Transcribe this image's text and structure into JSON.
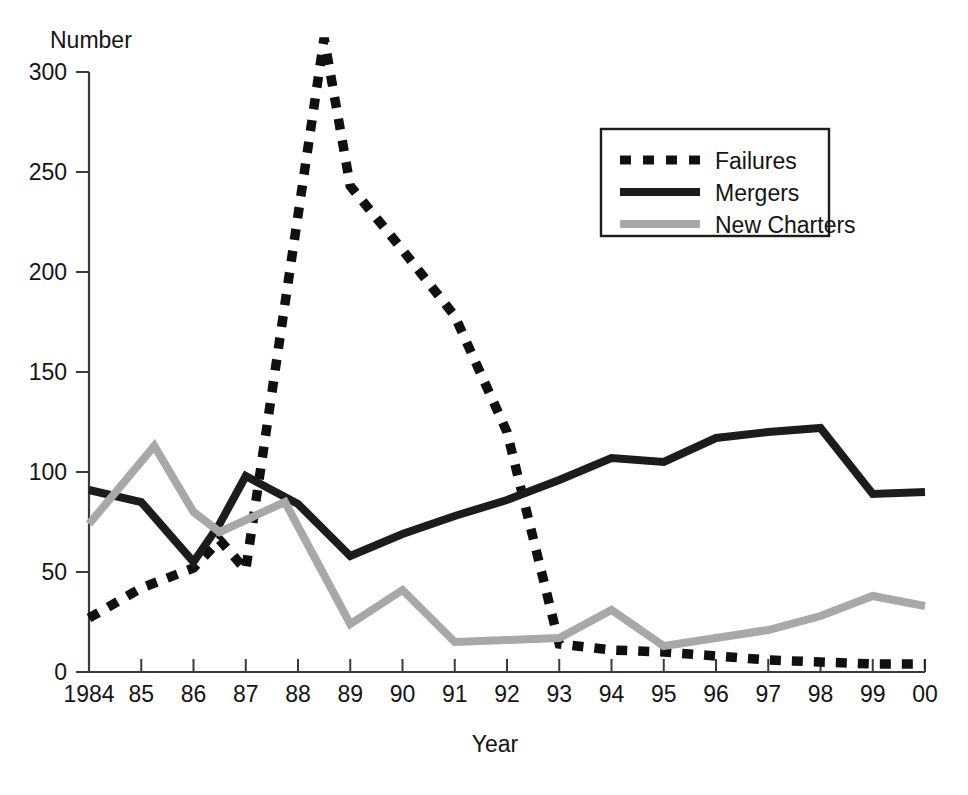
{
  "chart_data": {
    "type": "line",
    "title": "",
    "xlabel": "Year",
    "ylabel": "Number",
    "ylim": [
      0,
      300
    ],
    "yticks": [
      0,
      50,
      100,
      150,
      200,
      250,
      300
    ],
    "xlim": [
      1984,
      2000
    ],
    "xticks": [
      1984,
      1985,
      1986,
      1987,
      1988,
      1989,
      1990,
      1991,
      1992,
      1993,
      1994,
      1995,
      1996,
      1997,
      1998,
      1999,
      2000
    ],
    "xtick_labels": [
      "1984",
      "85",
      "86",
      "87",
      "88",
      "89",
      "90",
      "91",
      "92",
      "93",
      "94",
      "95",
      "96",
      "97",
      "98",
      "99",
      "00"
    ],
    "grid": false,
    "legend_position": "upper right",
    "x": [
      1984,
      1984.5,
      1985,
      1985.25,
      1985.5,
      1986,
      1986.5,
      1987,
      1987.75,
      1988,
      1988.5,
      1989,
      1990,
      1991,
      1992,
      1993,
      1994,
      1995,
      1996,
      1997,
      1998,
      1999,
      2000
    ],
    "series": [
      {
        "name": "Failures",
        "style": "dashed",
        "color": "#101010",
        "x": [
          1984,
          1985,
          1986,
          1986.5,
          1987,
          1988.5,
          1989,
          1990,
          1991,
          1992,
          1993,
          1994,
          1995,
          1996,
          1997,
          1998,
          1999,
          2000
        ],
        "values": [
          27,
          42,
          52,
          66,
          51,
          317,
          243,
          211,
          178,
          120,
          14,
          11,
          10,
          8,
          6,
          5,
          4,
          4
        ]
      },
      {
        "name": "Mergers",
        "style": "solid",
        "color": "#1c1c1c",
        "x": [
          1984,
          1985,
          1986,
          1986.5,
          1987,
          1988,
          1989,
          1990,
          1991,
          1992,
          1993,
          1994,
          1995,
          1996,
          1997,
          1998,
          1999,
          2000
        ],
        "values": [
          91,
          85,
          55,
          74,
          98,
          84,
          58,
          69,
          78,
          86,
          96,
          107,
          105,
          117,
          120,
          122,
          89,
          90
        ]
      },
      {
        "name": "New Charters",
        "style": "solid",
        "color": "#a8a8a8",
        "x": [
          1984,
          1985.25,
          1986,
          1986.5,
          1987.75,
          1989,
          1990,
          1991,
          1992,
          1993,
          1994,
          1995,
          1996,
          1997,
          1998,
          1999,
          2000
        ],
        "values": [
          74,
          113,
          80,
          70,
          85,
          24,
          41,
          15,
          16,
          17,
          31,
          13,
          17,
          21,
          28,
          38,
          33
        ]
      }
    ],
    "legend": [
      {
        "label": "Failures",
        "style": "dashed",
        "color": "#101010"
      },
      {
        "label": "Mergers",
        "style": "solid",
        "color": "#1c1c1c"
      },
      {
        "label": "New Charters",
        "style": "solid",
        "color": "#a8a8a8"
      }
    ]
  }
}
